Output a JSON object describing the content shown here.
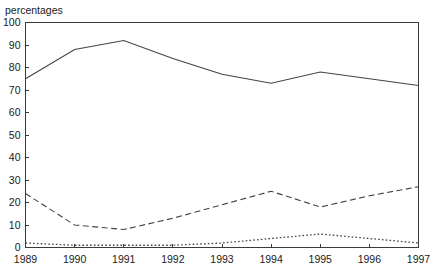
{
  "axis_title": "percentages",
  "chart_data": {
    "type": "line",
    "title": "",
    "subtitle": "",
    "xlabel": "",
    "ylabel": "percentages",
    "x": [
      1989,
      1990,
      1991,
      1992,
      1993,
      1994,
      1995,
      1996,
      1997
    ],
    "categories": [
      "1989",
      "1990",
      "1991",
      "1992",
      "1993",
      "1994",
      "1995",
      "1996",
      "1997"
    ],
    "xlim": [
      1989,
      1997
    ],
    "ylim": [
      0,
      100
    ],
    "ytick_labels": [
      "0",
      "10",
      "20",
      "30",
      "40",
      "50",
      "60",
      "70",
      "80",
      "90",
      "100"
    ],
    "ytick_values": [
      0,
      10,
      20,
      30,
      40,
      50,
      60,
      70,
      80,
      90,
      100
    ],
    "xtick_labels": [
      "1989",
      "1990",
      "1991",
      "1992",
      "1993",
      "1994",
      "1995",
      "1996",
      "1997"
    ],
    "grid": false,
    "legend": "none",
    "series": [
      {
        "name": "series-solid",
        "style": "solid",
        "color": "#444444",
        "values": [
          75,
          88,
          92,
          84,
          77,
          73,
          78,
          75,
          72
        ]
      },
      {
        "name": "series-dashed",
        "style": "dashed",
        "color": "#444444",
        "values": [
          24,
          10,
          8,
          13,
          19,
          25,
          18,
          23,
          27
        ]
      },
      {
        "name": "series-dotted",
        "style": "dotted",
        "color": "#444444",
        "values": [
          2,
          1,
          1,
          1,
          2,
          4,
          6,
          4,
          2
        ]
      }
    ]
  }
}
